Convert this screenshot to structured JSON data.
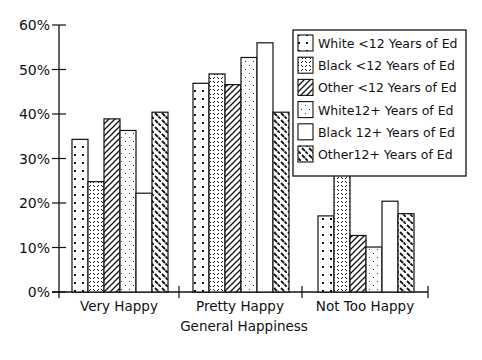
{
  "chart_data": {
    "type": "bar",
    "title": "",
    "xlabel": "General Happiness",
    "ylabel": "",
    "ylim": [
      0,
      60
    ],
    "yticks": [
      "0%",
      "10%",
      "20%",
      "30%",
      "40%",
      "50%",
      "60%"
    ],
    "grid": false,
    "legend_position": "upper right",
    "categories": [
      "Very Happy",
      "Pretty Happy",
      "Not Too Happy"
    ],
    "series": [
      {
        "name": "White <12 Years of Ed",
        "pattern": "dots",
        "values": [
          34.3,
          46.9,
          17.1
        ]
      },
      {
        "name": "Black  <12 Years of Ed",
        "pattern": "crosshatch-dashes",
        "values": [
          24.8,
          49.0,
          26.4
        ]
      },
      {
        "name": "Other <12 Years of Ed",
        "pattern": "diagonal-forward",
        "values": [
          38.9,
          46.6,
          12.7
        ]
      },
      {
        "name": "White12+ Years of Ed",
        "pattern": "fine-dots",
        "values": [
          36.3,
          52.7,
          10.1
        ]
      },
      {
        "name": "Black 12+ Years of Ed",
        "pattern": "blank",
        "values": [
          22.2,
          56.0,
          20.4
        ]
      },
      {
        "name": "Other12+ Years of Ed",
        "pattern": "diagonal-backward",
        "values": [
          40.4,
          40.4,
          17.6
        ]
      }
    ]
  }
}
